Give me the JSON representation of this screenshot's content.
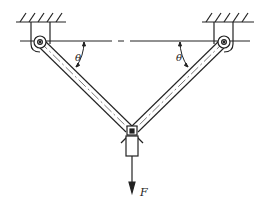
{
  "diagram": {
    "type": "two-bar truss with suspended load",
    "labels": {
      "angle_left": "θ",
      "angle_right": "θ",
      "force": "F"
    },
    "colors": {
      "line": "#222222",
      "background": "#ffffff"
    }
  }
}
